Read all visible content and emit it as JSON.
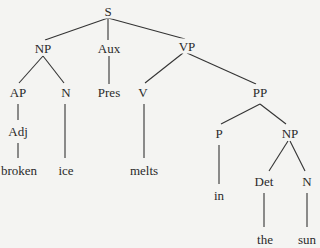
{
  "diagram": {
    "type": "syntax-tree",
    "edge_color": "#333333",
    "text_color": "#2a2a2a",
    "background": "#f4f4f2",
    "nodes": [
      {
        "id": "S",
        "label": "S",
        "x": 108,
        "y": 11
      },
      {
        "id": "NP1",
        "label": "NP",
        "x": 43,
        "y": 48
      },
      {
        "id": "Aux",
        "label": "Aux",
        "x": 109,
        "y": 48
      },
      {
        "id": "VP",
        "label": "VP",
        "x": 187,
        "y": 46
      },
      {
        "id": "AP",
        "label": "AP",
        "x": 18,
        "y": 92
      },
      {
        "id": "N1",
        "label": "N",
        "x": 66,
        "y": 92
      },
      {
        "id": "Pres",
        "label": "Pres",
        "x": 109,
        "y": 92
      },
      {
        "id": "V",
        "label": "V",
        "x": 143,
        "y": 92
      },
      {
        "id": "PP",
        "label": "PP",
        "x": 260,
        "y": 92
      },
      {
        "id": "Adj",
        "label": "Adj",
        "x": 18,
        "y": 131
      },
      {
        "id": "P",
        "label": "P",
        "x": 219,
        "y": 133
      },
      {
        "id": "NP2",
        "label": "NP",
        "x": 290,
        "y": 133
      },
      {
        "id": "broken",
        "label": "broken",
        "x": 19,
        "y": 170
      },
      {
        "id": "ice",
        "label": "ice",
        "x": 66,
        "y": 170
      },
      {
        "id": "melts",
        "label": "melts",
        "x": 144,
        "y": 170
      },
      {
        "id": "in",
        "label": "in",
        "x": 219,
        "y": 195
      },
      {
        "id": "Det",
        "label": "Det",
        "x": 264,
        "y": 181
      },
      {
        "id": "N2",
        "label": "N",
        "x": 307,
        "y": 181
      },
      {
        "id": "the",
        "label": "the",
        "x": 265,
        "y": 239
      },
      {
        "id": "sun",
        "label": "sun",
        "x": 307,
        "y": 239
      }
    ],
    "edges": [
      {
        "from": "S",
        "to": "NP1",
        "x1": 108,
        "y1": 18,
        "x2": 45,
        "y2": 40
      },
      {
        "from": "S",
        "to": "Aux",
        "x1": 108,
        "y1": 18,
        "x2": 108,
        "y2": 40
      },
      {
        "from": "S",
        "to": "VP",
        "x1": 108,
        "y1": 18,
        "x2": 185,
        "y2": 39
      },
      {
        "from": "NP1",
        "to": "AP",
        "x1": 43,
        "y1": 56,
        "x2": 19,
        "y2": 83
      },
      {
        "from": "NP1",
        "to": "N1",
        "x1": 43,
        "y1": 56,
        "x2": 64,
        "y2": 83
      },
      {
        "from": "Aux",
        "to": "Pres",
        "x1": 109,
        "y1": 56,
        "x2": 109,
        "y2": 84
      },
      {
        "from": "VP",
        "to": "V",
        "x1": 183,
        "y1": 53,
        "x2": 145,
        "y2": 83
      },
      {
        "from": "VP",
        "to": "PP",
        "x1": 187,
        "y1": 53,
        "x2": 256,
        "y2": 84
      },
      {
        "from": "AP",
        "to": "Adj",
        "x1": 18,
        "y1": 104,
        "x2": 18,
        "y2": 120
      },
      {
        "from": "N1",
        "to": "ice",
        "x1": 65,
        "y1": 104,
        "x2": 65,
        "y2": 158
      },
      {
        "from": "V",
        "to": "melts",
        "x1": 144,
        "y1": 104,
        "x2": 144,
        "y2": 158
      },
      {
        "from": "PP",
        "to": "P",
        "x1": 260,
        "y1": 104,
        "x2": 221,
        "y2": 124
      },
      {
        "from": "PP",
        "to": "NP2",
        "x1": 260,
        "y1": 104,
        "x2": 286,
        "y2": 124
      },
      {
        "from": "Adj",
        "to": "broken",
        "x1": 18,
        "y1": 143,
        "x2": 18,
        "y2": 158
      },
      {
        "from": "P",
        "to": "in",
        "x1": 219,
        "y1": 145,
        "x2": 219,
        "y2": 184
      },
      {
        "from": "NP2",
        "to": "Det",
        "x1": 288,
        "y1": 141,
        "x2": 269,
        "y2": 171
      },
      {
        "from": "NP2",
        "to": "N2",
        "x1": 290,
        "y1": 141,
        "x2": 305,
        "y2": 171
      },
      {
        "from": "Det",
        "to": "the",
        "x1": 264,
        "y1": 193,
        "x2": 264,
        "y2": 227
      },
      {
        "from": "N2",
        "to": "sun",
        "x1": 307,
        "y1": 193,
        "x2": 307,
        "y2": 227
      }
    ]
  }
}
